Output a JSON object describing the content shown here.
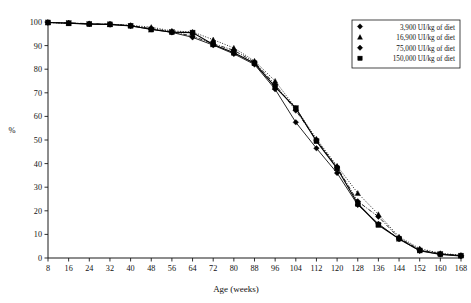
{
  "chart_data": {
    "type": "line",
    "title": "",
    "xlabel": "Age (weeks)",
    "ylabel": "%",
    "xlim": [
      8,
      168
    ],
    "ylim": [
      0,
      100
    ],
    "grid": false,
    "legend_position": "top-right",
    "x": [
      8,
      16,
      24,
      32,
      40,
      48,
      56,
      64,
      72,
      80,
      88,
      96,
      104,
      112,
      120,
      128,
      136,
      144,
      152,
      160,
      168
    ],
    "xticklabels": [
      "8",
      "16",
      "24",
      "32",
      "40",
      "48",
      "56",
      "64",
      "72",
      "80",
      "88",
      "96",
      "104",
      "112",
      "120",
      "128",
      "136",
      "144",
      "152",
      "160",
      "168"
    ],
    "yticklabels": [
      "0",
      "10",
      "20",
      "30",
      "40",
      "50",
      "60",
      "70",
      "80",
      "90",
      "100"
    ],
    "yticks": [
      0,
      10,
      20,
      30,
      40,
      50,
      60,
      70,
      80,
      90,
      100
    ],
    "series": [
      {
        "name": "3,900 UI/kg of diet",
        "marker": "diamond",
        "linestyle": "solid",
        "values": [
          99.8,
          99.5,
          99.2,
          98.9,
          98.3,
          97.0,
          95.6,
          93.5,
          90.2,
          86.5,
          82.0,
          71.5,
          57.5,
          46.5,
          36.0,
          22.5,
          14.5,
          8.0,
          3.0,
          1.5,
          0.8
        ]
      },
      {
        "name": "16,900 UI/kg of diet",
        "marker": "triangle",
        "linestyle": "dotted",
        "values": [
          99.8,
          99.4,
          99.3,
          99.0,
          98.6,
          97.8,
          96.2,
          95.8,
          92.5,
          89.0,
          83.5,
          75.0,
          63.5,
          50.5,
          39.0,
          27.5,
          18.5,
          9.0,
          4.0,
          2.0,
          1.2
        ]
      },
      {
        "name": "75,000 UI/kg of diet",
        "marker": "diamond",
        "linestyle": "dashdot",
        "values": [
          99.8,
          99.6,
          99.3,
          99.1,
          98.5,
          97.2,
          95.9,
          94.0,
          90.8,
          88.0,
          83.0,
          73.5,
          62.5,
          50.0,
          38.5,
          24.0,
          17.5,
          8.5,
          3.5,
          1.8,
          1.0
        ]
      },
      {
        "name": "150,000 UI/kg of diet",
        "marker": "square",
        "linestyle": "solid",
        "values": [
          99.8,
          99.5,
          99.1,
          99.0,
          98.4,
          96.8,
          95.7,
          95.5,
          90.5,
          87.0,
          82.5,
          72.5,
          63.5,
          49.5,
          38.0,
          23.0,
          14.0,
          8.2,
          3.2,
          1.6,
          1.0
        ]
      }
    ]
  },
  "legend": {
    "items": [
      {
        "label": "3,900 UI/kg of diet",
        "marker": "diamond-marker-icon"
      },
      {
        "label": "16,900 UI/kg of diet",
        "marker": "triangle-marker-icon"
      },
      {
        "label": "75,000 UI/kg of diet",
        "marker": "diamond-marker-icon"
      },
      {
        "label": "150,000 UI/kg of diet",
        "marker": "square-marker-icon"
      }
    ]
  },
  "colors": {
    "axis": "#1a1a1a",
    "series": "#000000",
    "background": "#ffffff"
  }
}
